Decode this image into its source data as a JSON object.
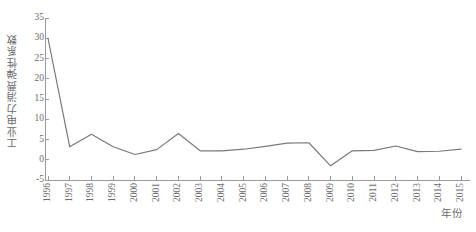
{
  "chart_data": {
    "type": "line",
    "title": "",
    "xlabel": "年份",
    "ylabel": "工业电力消费弹性系数",
    "categories": [
      "1996",
      "1997",
      "1998",
      "1999",
      "2000",
      "2001",
      "2002",
      "2003",
      "2004",
      "2005",
      "2006",
      "2007",
      "2008",
      "2009",
      "2010",
      "2011",
      "2012",
      "2013",
      "2014",
      "2015"
    ],
    "values": [
      30.0,
      3.2,
      6.3,
      3.2,
      1.3,
      2.5,
      6.5,
      2.2,
      2.2,
      2.6,
      3.3,
      4.1,
      4.2,
      -1.5,
      2.2,
      2.3,
      3.4,
      2.0,
      2.1,
      2.6
    ],
    "series": [
      {
        "name": "工业电力消费弹性系数",
        "values": [
          30.0,
          3.2,
          6.3,
          3.2,
          1.3,
          2.5,
          6.5,
          2.2,
          2.2,
          2.6,
          3.3,
          4.1,
          4.2,
          -1.5,
          2.2,
          2.3,
          3.4,
          2.0,
          2.1,
          2.6
        ]
      }
    ],
    "ylim": [
      -5,
      35
    ],
    "yticks": [
      -5,
      0,
      5,
      10,
      15,
      20,
      25,
      30,
      35
    ],
    "ytick_labels": [
      "-5",
      "0",
      "5",
      "10",
      "15",
      "20",
      "25",
      "30",
      "35"
    ],
    "xtick_labels": [
      "1996",
      "1997",
      "1998",
      "1999",
      "2000",
      "2001",
      "2002",
      "2003",
      "2004",
      "2005",
      "2006",
      "2007",
      "2008",
      "2009",
      "2010",
      "2011",
      "2012",
      "2013",
      "2014",
      "2015"
    ],
    "grid": false,
    "legend": "none",
    "line_color": "#7a7a7a",
    "axis_color": "#9a9a9a",
    "text_color": "#6d6d6d",
    "background": "#ffffff"
  }
}
